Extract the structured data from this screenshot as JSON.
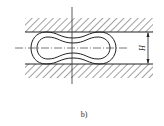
{
  "figure": {
    "caption": "b)",
    "dimension_label": "H",
    "colors": {
      "line": "#222222",
      "background": "#ffffff"
    },
    "elements": [
      "top-wall-hatched",
      "bottom-wall-hatched",
      "outer-dogbone-contour",
      "inner-dogbone-contour",
      "vertical-centerline",
      "horizontal-centerline",
      "height-dimension-arrow"
    ]
  }
}
